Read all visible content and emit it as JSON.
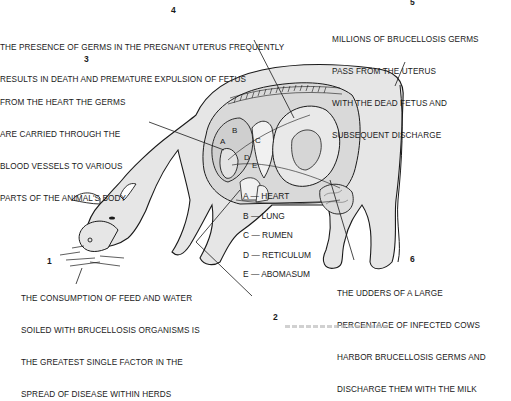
{
  "diagram": {
    "callouts": [
      {
        "number": "1",
        "lines": [
          "THE CONSUMPTION OF FEED AND WATER",
          "SOILED WITH BRUCELLOSIS ORGANISMS IS",
          "THE GREATEST SINGLE FACTOR IN THE",
          "SPREAD OF DISEASE WITHIN HERDS"
        ]
      },
      {
        "number": "2",
        "lines": []
      },
      {
        "number": "3",
        "lines": [
          "FROM THE HEART THE GERMS",
          "ARE CARRIED THROUGH THE",
          "BLOOD VESSELS TO VARIOUS",
          "PARTS OF THE ANIMAL'S BODY"
        ]
      },
      {
        "number": "4",
        "lines": [
          "THE PRESENCE OF GERMS IN THE PREGNANT UTERUS FREQUENTLY",
          "RESULTS IN DEATH AND PREMATURE EXPULSION OF FETUS"
        ]
      },
      {
        "number": "5",
        "lines": [
          "MILLIONS OF BRUCELLOSIS GERMS",
          "PASS FROM THE UTERUS",
          "WITH THE DEAD FETUS AND",
          "SUBSEQUENT DISCHARGE"
        ]
      },
      {
        "number": "6",
        "lines": [
          "THE UDDERS OF A LARGE",
          "PERCENTAGE OF INFECTED COWS",
          "HARBOR BRUCELLOSIS GERMS AND",
          "DISCHARGE THEM WITH THE MILK"
        ]
      }
    ],
    "legend": [
      {
        "key": "A",
        "label": "A — HEART"
      },
      {
        "key": "B",
        "label": "B — LUNG"
      },
      {
        "key": "C",
        "label": "C — RUMEN"
      },
      {
        "key": "D",
        "label": "D — RETICULUM"
      },
      {
        "key": "E",
        "label": "E — ABOMASUM"
      }
    ],
    "organ_letters": [
      "A",
      "B",
      "C",
      "D",
      "E"
    ],
    "colors": {
      "ink": "#1a1a1a",
      "body_fill": "#e6e6e6",
      "organ_fill": "#d4d4d4",
      "paper": "#ffffff"
    }
  }
}
